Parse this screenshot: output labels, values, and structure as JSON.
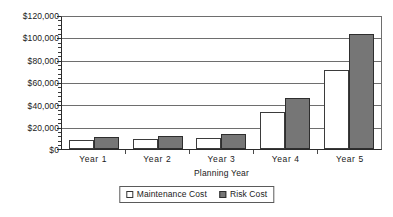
{
  "chart_data": {
    "type": "bar",
    "title": "",
    "xlabel": "Planning Year",
    "ylabel": "",
    "categories": [
      "Year 1",
      "Year 2",
      "Year 3",
      "Year 4",
      "Year 5"
    ],
    "series": [
      {
        "name": "Maintenance Cost",
        "color": "#ffffff",
        "values": [
          8000,
          9000,
          10000,
          33500,
          72000
        ]
      },
      {
        "name": "Risk Cost",
        "color": "#767676",
        "values": [
          10500,
          11500,
          14000,
          46500,
          104500
        ]
      }
    ],
    "ylim": [
      0,
      120000
    ],
    "ytick_values": [
      0,
      20000,
      40000,
      60000,
      80000,
      100000,
      120000
    ],
    "ytick_labels": [
      "$0",
      "$20,000",
      "$40,000",
      "$60,000",
      "$80,000",
      "$100,000",
      "$120,000"
    ],
    "grid": true,
    "grid_axis": "y",
    "minor_ticks_y": true,
    "legend_position": "bottom",
    "legend_entries": [
      "Maintenance Cost",
      "Risk Cost"
    ],
    "plot_background": "#ffffff",
    "axis_color": "#2b2b2b",
    "gridline_color": "#6e6e6e"
  }
}
